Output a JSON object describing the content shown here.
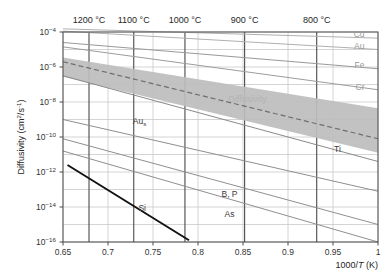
{
  "chart_data": {
    "type": "line",
    "title": "",
    "xlabel": "1000/T (K)",
    "ylabel": "Diffusivity (cm2/s-1)",
    "ylabel_parts": {
      "base": "Diffusivity (cm",
      "sup1": "2",
      "mid": "/s",
      "sup2": "-1",
      "tail": ")"
    },
    "xlim": [
      0.65,
      1.0
    ],
    "ylim_exponents": [
      -16,
      -4
    ],
    "grid": true,
    "legend_position": "inline-labels",
    "x_ticks": [
      "0.65",
      "0.7",
      "0.75",
      "0.8",
      "0.85",
      "0.9",
      "0.95",
      "1"
    ],
    "x_tick_values": [
      0.65,
      0.7,
      0.75,
      0.8,
      0.85,
      0.9,
      0.95,
      1.0
    ],
    "y_ticks": [
      "10-4",
      "10-6",
      "10-8",
      "10-10",
      "10-12",
      "10-14",
      "10-16"
    ],
    "y_tick_exponents": [
      -4,
      -6,
      -8,
      -10,
      -12,
      -14,
      -16
    ],
    "secondary_axis": {
      "label": "Temperature",
      "unit": "°C",
      "ticks": [
        {
          "label": "1200 °C",
          "x": 0.6789
        },
        {
          "label": "1100 °C",
          "x": 0.7286
        },
        {
          "label": "1000 °C",
          "x": 0.7855
        },
        {
          "label": "900 °C",
          "x": 0.8518
        },
        {
          "label": "800 °C",
          "x": 0.9319
        }
      ]
    },
    "band": {
      "name": "Diffusivity",
      "label": "Diffusivity",
      "color": "#bdbdbd",
      "upper": [
        {
          "x": 0.65,
          "y_exp": -5.45
        },
        {
          "x": 1.0,
          "y_exp": -8.35
        }
      ],
      "lower": [
        {
          "x": 0.65,
          "y_exp": -6.55
        },
        {
          "x": 1.0,
          "y_exp": -10.9
        }
      ],
      "dashed_center": [
        {
          "x": 0.65,
          "y_exp": -5.7
        },
        {
          "x": 1.0,
          "y_exp": -10.1
        }
      ]
    },
    "series": [
      {
        "name": "Cu",
        "label": "Cu",
        "color": "#b0b0b0",
        "width": 1.0,
        "points": [
          {
            "x": 0.65,
            "y_exp": -3.82
          },
          {
            "x": 1.0,
            "y_exp": -4.35
          }
        ]
      },
      {
        "name": "Au",
        "label": "Au",
        "color": "#b0b0b0",
        "width": 1.0,
        "points": [
          {
            "x": 0.65,
            "y_exp": -3.95
          },
          {
            "x": 1.0,
            "y_exp": -5.0
          }
        ]
      },
      {
        "name": "Fe",
        "label": "Fe",
        "color": "#999999",
        "width": 1.0,
        "points": [
          {
            "x": 0.65,
            "y_exp": -4.6
          },
          {
            "x": 1.0,
            "y_exp": -6.1
          }
        ]
      },
      {
        "name": "Cr",
        "label": "Cr",
        "color": "#9c9c9c",
        "width": 1.0,
        "points": [
          {
            "x": 0.65,
            "y_exp": -4.85
          },
          {
            "x": 1.0,
            "y_exp": -7.3
          }
        ]
      },
      {
        "name": "Ti",
        "label": "Ti",
        "color": "#8a8a8a",
        "width": 1.0,
        "points": [
          {
            "x": 0.65,
            "y_exp": -6.5
          },
          {
            "x": 1.0,
            "y_exp": -11.4
          }
        ]
      },
      {
        "name": "Au_s",
        "label": "Au",
        "label_sub": "s",
        "color": "#8f8f8f",
        "width": 1.0,
        "points": [
          {
            "x": 0.65,
            "y_exp": -9.0
          },
          {
            "x": 1.0,
            "y_exp": -13.1
          }
        ]
      },
      {
        "name": "B_P",
        "label": "B, P",
        "color": "#8f8f8f",
        "width": 1.0,
        "points": [
          {
            "x": 0.65,
            "y_exp": -10.1
          },
          {
            "x": 1.0,
            "y_exp": -15.0
          }
        ]
      },
      {
        "name": "As",
        "label": "As",
        "color": "#8f8f8f",
        "width": 1.0,
        "points": [
          {
            "x": 0.65,
            "y_exp": -10.8
          },
          {
            "x": 1.0,
            "y_exp": -16.0
          }
        ]
      },
      {
        "name": "Si",
        "label": "Si",
        "color": "#111111",
        "width": 1.9,
        "points": [
          {
            "x": 0.655,
            "y_exp": -11.6
          },
          {
            "x": 0.79,
            "y_exp": -15.9
          }
        ]
      }
    ],
    "annotations": [
      {
        "text": "Diffusivity",
        "x": 0.855,
        "y_exp": -8.0,
        "style": "band"
      },
      {
        "text": "Cu",
        "x": 0.985,
        "y_exp": -4.3,
        "style": "faint"
      },
      {
        "text": "Au",
        "x": 0.985,
        "y_exp": -4.95,
        "style": "faint"
      },
      {
        "text": "Fe",
        "x": 0.985,
        "y_exp": -6.05,
        "style": "faint"
      },
      {
        "text": "Cr",
        "x": 0.985,
        "y_exp": -7.3,
        "style": "faint"
      },
      {
        "text": "Ti",
        "x": 0.955,
        "y_exp": -10.85,
        "style": "normal"
      },
      {
        "text": "Au",
        "sub": "s",
        "x": 0.735,
        "y_exp": -9.25,
        "style": "normal"
      },
      {
        "text": "Si",
        "x": 0.738,
        "y_exp": -14.2,
        "style": "normal"
      },
      {
        "text": "B, P",
        "x": 0.835,
        "y_exp": -13.4,
        "style": "normal"
      },
      {
        "text": "As",
        "x": 0.835,
        "y_exp": -14.55,
        "style": "normal"
      }
    ]
  },
  "colors": {
    "plot_border": "#4d4d4d",
    "grid_minor": "#c9c9c9",
    "grid_temp": "#4a4a4a",
    "band_fill": "#bdbdbd",
    "background": "#ffffff",
    "text": "#2b2b2b"
  }
}
